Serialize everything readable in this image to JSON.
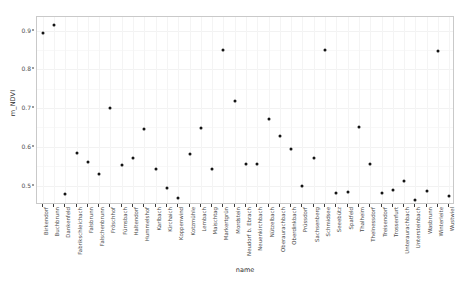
{
  "chart_data": {
    "type": "scatter",
    "title": "",
    "xlabel": "name",
    "ylabel": "m_NDVI",
    "ylim": [
      0.45,
      0.935
    ],
    "yticks": [
      0.5,
      0.6,
      0.7,
      0.8,
      0.9
    ],
    "ytick_labels": [
      "0.5",
      "0.6",
      "0.7",
      "0.8",
      "0.9"
    ],
    "grid": true,
    "legend": "none",
    "categories": [
      "Birkendorf",
      "Buchbrunn",
      "Dankenfeld",
      "Fabrikschleichach",
      "Falsbrunn",
      "Falschenbrunn",
      "Fröschhof",
      "Fürnsbach",
      "Haltendorf",
      "Hummelshof",
      "Karlbach",
      "Kirchaich",
      "Koppenwind",
      "Kotzmühle",
      "Lembach",
      "Maischtag",
      "Markertgrün",
      "Mordstein",
      "Neudorf b. Ebrach",
      "Neuenkirchbach",
      "Nützelbach",
      "Oberaurachbach",
      "Oberdinkbach",
      "Prüssdorf",
      "Sachsenberg",
      "Schmidsee",
      "Seeebütz",
      "Spatfeld",
      "Thalheim",
      "Thelnessdorf",
      "Treisendorf",
      "Trossenfurt",
      "Unteraurachbach",
      "Untersteinbach",
      "Wasbrunn",
      "Winterleite",
      "Wustwiel"
    ],
    "points": [
      {
        "name": "Birkendorf",
        "value": 0.893
      },
      {
        "name": "Buchbrunn",
        "value": 0.914
      },
      {
        "name": "Dankenfeld",
        "value": 0.479
      },
      {
        "name": "Fabrikschleichach",
        "value": 0.584
      },
      {
        "name": "Falsbrunn",
        "value": 0.561
      },
      {
        "name": "Falschenbrunn",
        "value": 0.531
      },
      {
        "name": "Fröschhof",
        "value": 0.701
      },
      {
        "name": "Fürnsbach",
        "value": 0.554
      },
      {
        "name": "Haltendorf",
        "value": 0.57
      },
      {
        "name": "Hummelshof",
        "value": 0.646
      },
      {
        "name": "Karlbach",
        "value": 0.543
      },
      {
        "name": "Kirchaich",
        "value": 0.494
      },
      {
        "name": "Koppenwind",
        "value": 0.467
      },
      {
        "name": "Kotzmühle",
        "value": 0.581
      },
      {
        "name": "Lembach",
        "value": 0.648
      },
      {
        "name": "Maischtag",
        "value": 0.544
      },
      {
        "name": "Markertgrün",
        "value": 0.85
      },
      {
        "name": "Mordstein",
        "value": 0.718
      },
      {
        "name": "Neudorf b. Ebrach",
        "value": 0.557
      },
      {
        "name": "Neuenkirchbach",
        "value": 0.556
      },
      {
        "name": "Nützelbach",
        "value": 0.671
      },
      {
        "name": "Oberaurachbach",
        "value": 0.627
      },
      {
        "name": "Oberdinkbach",
        "value": 0.594
      },
      {
        "name": "Prüssdorf",
        "value": 0.499
      },
      {
        "name": "Sachsenberg",
        "value": 0.572
      },
      {
        "name": "Schmidsee",
        "value": 0.851
      },
      {
        "name": "Seeebütz",
        "value": 0.481
      },
      {
        "name": "Spatfeld",
        "value": 0.484
      },
      {
        "name": "Thalheim",
        "value": 0.652
      },
      {
        "name": "Thelnessdorf",
        "value": 0.557
      },
      {
        "name": "Treisendorf",
        "value": 0.481
      },
      {
        "name": "Trossenfurt",
        "value": 0.489
      },
      {
        "name": "Unteraurachbach",
        "value": 0.513
      },
      {
        "name": "Untersteinbach",
        "value": 0.463
      },
      {
        "name": "Wasbrunn",
        "value": 0.487
      },
      {
        "name": "Winterleite",
        "value": 0.846
      },
      {
        "name": "Wustwiel",
        "value": 0.474
      }
    ]
  }
}
